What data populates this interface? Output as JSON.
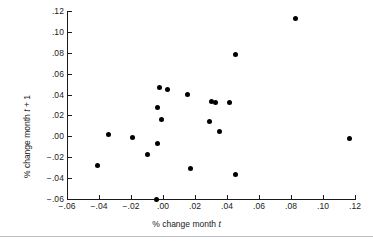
{
  "chart_data": {
    "type": "scatter",
    "title": "",
    "xlabel": "% change month t",
    "xlabel_prefix": "% change month ",
    "xlabel_var": "t",
    "ylabel": "% change month t + 1",
    "ylabel_prefix": "% change month ",
    "ylabel_var": "t",
    "ylabel_suffix": " + 1",
    "xlim": [
      -0.06,
      0.12
    ],
    "ylim": [
      -0.06,
      0.12
    ],
    "grid": false,
    "legend": null,
    "marker": "filled-circle",
    "marker_color": "#000000",
    "axis_color": "#1a1a1a",
    "background_color": "#ffffff",
    "xticks": [
      -0.06,
      -0.04,
      -0.02,
      0.0,
      0.02,
      0.04,
      0.06,
      0.08,
      0.1,
      0.12
    ],
    "xticklabels": [
      "−.06",
      "−.04",
      "−.02",
      ".00",
      ".02",
      ".04",
      ".06",
      ".08",
      ".10",
      ".12"
    ],
    "yticks": [
      -0.06,
      -0.04,
      -0.02,
      0.0,
      0.02,
      0.04,
      0.06,
      0.08,
      0.1,
      0.12
    ],
    "yticklabels": [
      "−.06",
      "−.04",
      "−.02",
      ".00",
      ".02",
      ".04",
      ".06",
      ".08",
      ".10",
      ".12"
    ],
    "points": [
      {
        "x": 0.083,
        "y": 0.1125
      },
      {
        "x": 0.0456,
        "y": 0.0785
      },
      {
        "x": -0.0025,
        "y": 0.0465
      },
      {
        "x": 0.0025,
        "y": 0.0445
      },
      {
        "x": 0.0152,
        "y": 0.0405
      },
      {
        "x": 0.03,
        "y": 0.0335
      },
      {
        "x": 0.0331,
        "y": 0.0325
      },
      {
        "x": 0.0414,
        "y": 0.0325
      },
      {
        "x": -0.0033,
        "y": 0.0275
      },
      {
        "x": -0.0008,
        "y": 0.0165
      },
      {
        "x": 0.0288,
        "y": 0.0145
      },
      {
        "x": 0.0352,
        "y": 0.0045
      },
      {
        "x": -0.0342,
        "y": 0.0015
      },
      {
        "x": -0.0189,
        "y": -0.001
      },
      {
        "x": 0.1163,
        "y": -0.0025
      },
      {
        "x": -0.0033,
        "y": -0.0065
      },
      {
        "x": -0.0098,
        "y": -0.0175
      },
      {
        "x": -0.0408,
        "y": -0.0275
      },
      {
        "x": 0.0169,
        "y": -0.0305
      },
      {
        "x": 0.0452,
        "y": -0.0365
      },
      {
        "x": -0.0038,
        "y": -0.06
      }
    ]
  }
}
